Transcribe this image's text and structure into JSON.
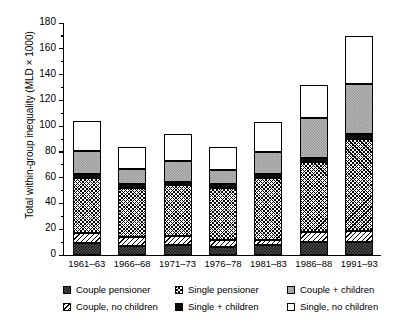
{
  "chart_data": {
    "type": "bar",
    "stacked": true,
    "title": "",
    "xlabel": "",
    "ylabel": "Total within-group inequality (MLD × 1000)",
    "ylim": [
      0,
      180
    ],
    "ytick_step": 20,
    "yticks": [
      "0",
      "20",
      "40",
      "60",
      "80",
      "100",
      "120",
      "140",
      "160",
      "180"
    ],
    "grid": false,
    "legend_position": "bottom",
    "categories": [
      "1961–63",
      "1966–68",
      "1971–73",
      "1976–78",
      "1981–83",
      "1986–88",
      "1991–93"
    ],
    "series": [
      {
        "name": "Couple pensioner",
        "pattern": "p-couple-pens",
        "values": [
          9,
          7,
          8,
          6,
          8,
          10,
          10
        ]
      },
      {
        "name": "Couple, no children",
        "pattern": "p-couple-nochild",
        "values": [
          8,
          7,
          7,
          6,
          4,
          8,
          9
        ]
      },
      {
        "name": "Single pensioner",
        "pattern": "p-single-pens",
        "values": [
          43,
          38,
          39,
          40,
          48,
          54,
          71
        ]
      },
      {
        "name": "Single + children",
        "pattern": "p-single-child",
        "values": [
          3,
          3,
          3,
          3,
          3,
          3,
          4
        ]
      },
      {
        "name": "Couple + children",
        "pattern": "p-couple-child",
        "values": [
          18,
          12,
          16,
          11,
          17,
          31,
          39
        ]
      },
      {
        "name": "Single, no children",
        "pattern": "p-single-nochild",
        "values": [
          23,
          17,
          21,
          18,
          23,
          26,
          37
        ]
      }
    ],
    "totals": [
      104,
      84,
      94,
      84,
      103,
      132,
      170
    ]
  },
  "legend": {
    "items": [
      {
        "label": "Couple pensioner",
        "pattern": "p-couple-pens"
      },
      {
        "label": "Single pensioner",
        "pattern": "p-single-pens"
      },
      {
        "label": "Couple + children",
        "pattern": "p-couple-child"
      },
      {
        "label": "Couple, no children",
        "pattern": "p-couple-nochild"
      },
      {
        "label": "Single + children",
        "pattern": "p-single-child"
      },
      {
        "label": "Single, no children",
        "pattern": "p-single-nochild"
      }
    ]
  },
  "colors": {
    "axis": "#000000",
    "background": "#ffffff",
    "couple_pensioner": "#4a4a4a",
    "single_plus_children": "#0d0d0d",
    "couple_plus_children": "#b9b9b9"
  }
}
